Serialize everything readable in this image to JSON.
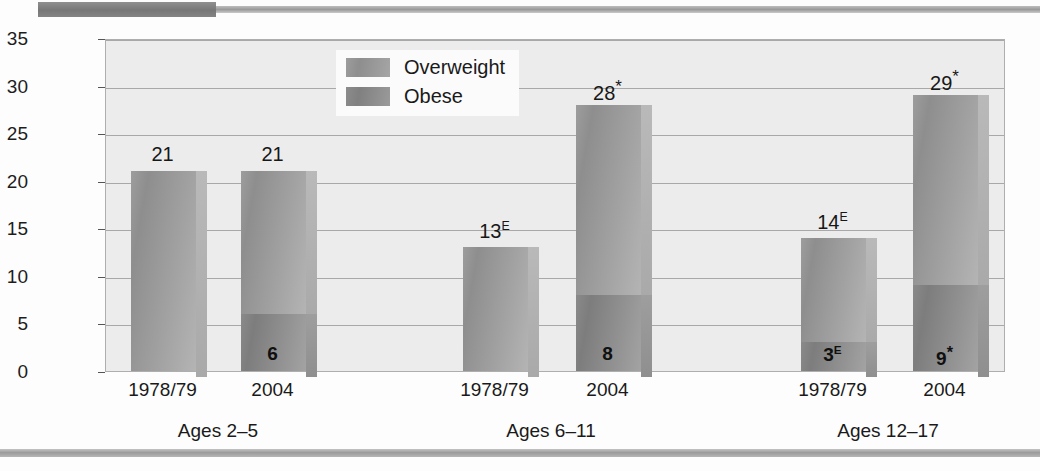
{
  "chart_data": {
    "type": "bar",
    "subtype": "stacked",
    "title": "",
    "xlabel": "",
    "ylabel": "Percentage",
    "ylim": [
      0,
      35
    ],
    "yticks": [
      0,
      5,
      10,
      15,
      20,
      25,
      30,
      35
    ],
    "ytick_labels": [
      "0",
      "5",
      "10",
      "15",
      "20",
      "25",
      "30",
      "35"
    ],
    "grid": true,
    "legend_position": "top-center",
    "legend": [
      "Overweight",
      "Obese"
    ],
    "groups": [
      "Ages 2–5",
      "Ages 6–11",
      "Ages 12–17"
    ],
    "categories": [
      "1978/79",
      "2004",
      "1978/79",
      "2004",
      "1978/79",
      "2004"
    ],
    "series": [
      {
        "name": "Overweight",
        "values": [
          21,
          21,
          13,
          28,
          14,
          29
        ],
        "note": "total bar height (overweight includes obese portion)"
      },
      {
        "name": "Obese",
        "values": [
          0,
          6,
          0,
          8,
          3,
          9
        ]
      }
    ],
    "bars": [
      {
        "group": "Ages 2–5",
        "category": "1978/79",
        "total": 21,
        "total_label": "21",
        "total_suffix": "",
        "obese": 0,
        "obese_label": "",
        "obese_suffix": ""
      },
      {
        "group": "Ages 2–5",
        "category": "2004",
        "total": 21,
        "total_label": "21",
        "total_suffix": "",
        "obese": 6,
        "obese_label": "6",
        "obese_suffix": ""
      },
      {
        "group": "Ages 6–11",
        "category": "1978/79",
        "total": 13,
        "total_label": "13",
        "total_suffix": "E",
        "obese": 0,
        "obese_label": "",
        "obese_suffix": ""
      },
      {
        "group": "Ages 6–11",
        "category": "2004",
        "total": 28,
        "total_label": "28",
        "total_suffix": "*",
        "obese": 8,
        "obese_label": "8",
        "obese_suffix": ""
      },
      {
        "group": "Ages 12–17",
        "category": "1978/79",
        "total": 14,
        "total_label": "14",
        "total_suffix": "E",
        "obese": 3,
        "obese_label": "3",
        "obese_suffix": "E"
      },
      {
        "group": "Ages 12–17",
        "category": "2004",
        "total": 29,
        "total_label": "29",
        "total_suffix": "*",
        "obese": 9,
        "obese_label": "9",
        "obese_suffix": "*"
      }
    ],
    "colors": {
      "overweight": "#9b9b9b",
      "obese": "#858585",
      "plot_background": "#ececec",
      "gridline": "#a8a8a8",
      "text": "#1a1a1a"
    }
  }
}
